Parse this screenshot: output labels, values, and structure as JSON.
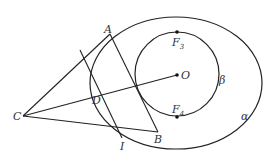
{
  "diagram": {
    "curves": {
      "outer": {
        "label": "α",
        "cx": 176,
        "cy": 83,
        "rx": 86,
        "ry": 66
      },
      "inner": {
        "label": "β",
        "cx": 177,
        "cy": 74,
        "r": 42
      }
    },
    "points": {
      "A": {
        "label": "A",
        "x": 110,
        "y": 33
      },
      "B": {
        "label": "B",
        "x": 158,
        "y": 132
      },
      "C": {
        "label": "C",
        "x": 23,
        "y": 116
      },
      "D": {
        "label": "D",
        "x": 101,
        "y": 95
      },
      "O": {
        "label": "O",
        "x": 177,
        "y": 75
      },
      "F3": {
        "label": "F",
        "sub": "3",
        "x": 177,
        "y": 32
      },
      "F4": {
        "label": "F",
        "sub": "4",
        "x": 177,
        "y": 116
      },
      "I": {
        "label": "I",
        "x": 122,
        "y": 140
      }
    },
    "labels": {
      "A": "A",
      "B": "B",
      "C": "C",
      "D": "D",
      "O": "O",
      "F": "F",
      "F3_sub": "3",
      "F4_sub": "4",
      "I": "I",
      "alpha": "α",
      "beta": "β"
    }
  }
}
